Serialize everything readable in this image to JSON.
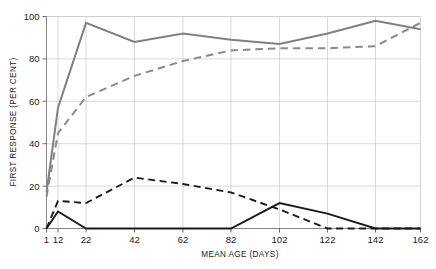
{
  "chart_data": {
    "type": "line",
    "title": "",
    "xlabel": "MEAN AGE (DAYS)",
    "ylabel": "FIRST RESPONSE (PER CENT)",
    "x": [
      1,
      12,
      22,
      42,
      62,
      82,
      102,
      122,
      142,
      162
    ],
    "xtick_labels": [
      "1",
      "12",
      "22",
      "42",
      "62",
      "82",
      "102",
      "122",
      "142",
      "162"
    ],
    "ytick_labels": [
      "0",
      "20",
      "40",
      "60",
      "80",
      "100"
    ],
    "yticks": [
      0,
      20,
      40,
      60,
      80,
      100
    ],
    "xlim": [
      1,
      162
    ],
    "ylim": [
      0,
      100
    ],
    "grid": true,
    "legend_position": "none",
    "series": [
      {
        "name": "grey-solid",
        "style": "solid",
        "color": "#808080",
        "width": 2.0,
        "values": [
          17,
          57,
          97,
          88,
          92,
          89,
          87,
          92,
          98,
          94
        ]
      },
      {
        "name": "grey-dashed",
        "style": "dashed",
        "color": "#8a8a8a",
        "width": 2.0,
        "values": [
          15,
          45,
          62,
          72,
          79,
          84,
          85,
          85,
          86,
          97
        ]
      },
      {
        "name": "black-dashed",
        "style": "dashed",
        "color": "#1a1a1a",
        "width": 1.9,
        "values": [
          0,
          13,
          12,
          24,
          21,
          17,
          9,
          0,
          0,
          0
        ]
      },
      {
        "name": "black-solid",
        "style": "solid",
        "color": "#1a1a1a",
        "width": 1.9,
        "values": [
          0,
          8,
          0,
          0,
          0,
          0,
          12,
          7,
          0,
          0
        ]
      }
    ]
  },
  "axes": {
    "y_title": "FIRST RESPONSE (PER CENT)",
    "x_title": "MEAN AGE (DAYS)"
  }
}
